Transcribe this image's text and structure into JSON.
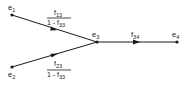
{
  "diagram": {
    "type": "signal-flow-graph",
    "nodes": [
      {
        "id": "e1",
        "label": "e",
        "sub": "1",
        "x": 12,
        "y": 15
      },
      {
        "id": "e2",
        "label": "e",
        "sub": "2",
        "x": 12,
        "y": 67
      },
      {
        "id": "e3",
        "label": "e",
        "sub": "3",
        "x": 97,
        "y": 42
      },
      {
        "id": "e4",
        "label": "e",
        "sub": "4",
        "x": 177,
        "y": 42
      }
    ],
    "edges": [
      {
        "from": "e1",
        "to": "e3",
        "gain": {
          "numerator": "f",
          "num_sub": "13",
          "denominator": "1 - f",
          "den_sub": "33"
        }
      },
      {
        "from": "e2",
        "to": "e3",
        "gain": {
          "numerator": "f",
          "num_sub": "23",
          "denominator": "1 - f",
          "den_sub": "33"
        }
      },
      {
        "from": "e3",
        "to": "e4",
        "gain": {
          "label": "f",
          "sub": "34"
        }
      }
    ],
    "colors": {
      "line": "#1a1a1a",
      "background": "#ffffff"
    }
  }
}
